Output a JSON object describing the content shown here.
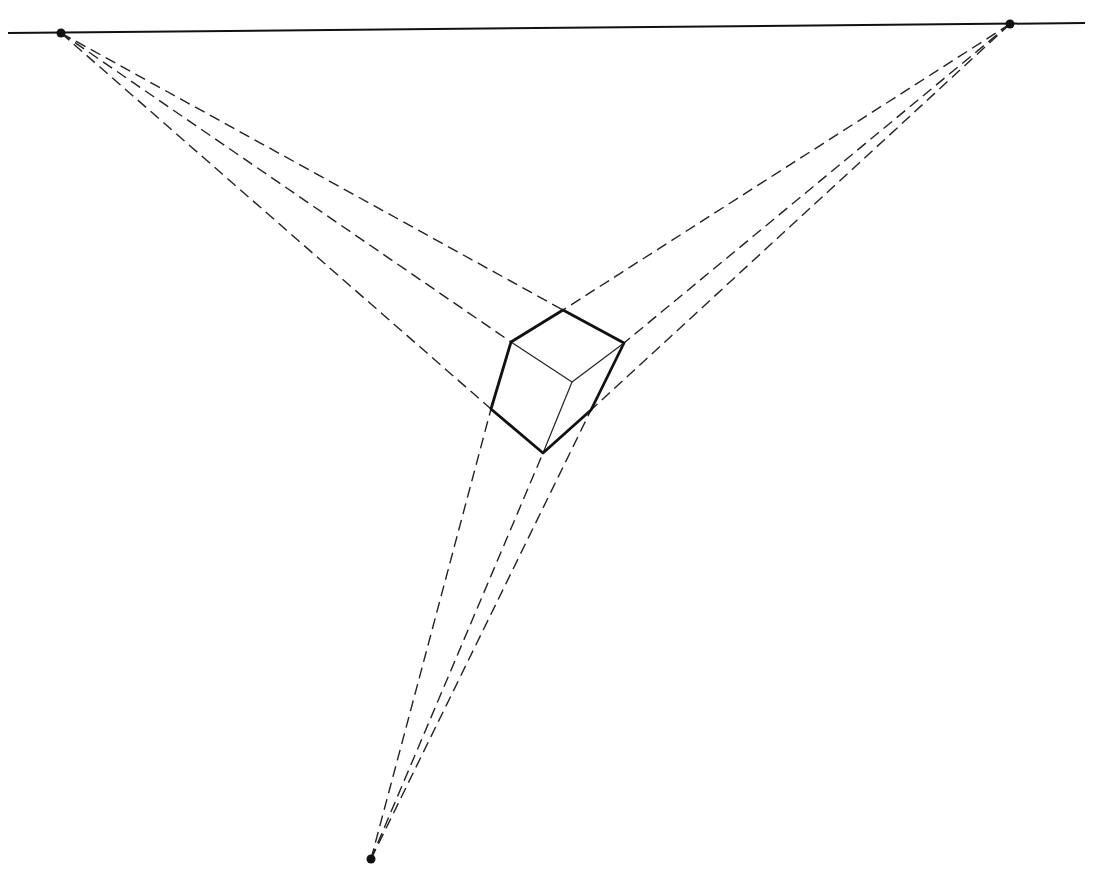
{
  "diagram": {
    "type": "three-point-perspective",
    "canvas": {
      "width": 1102,
      "height": 887,
      "background": "#ffffff"
    },
    "colors": {
      "ink": "#111111"
    },
    "horizon": {
      "x1": 8,
      "y1": 33,
      "x2": 1085,
      "y2": 23
    },
    "vanishing_points": [
      {
        "id": "vp-left",
        "x": 61,
        "y": 33
      },
      {
        "id": "vp-right",
        "x": 1010,
        "y": 24
      },
      {
        "id": "vp-bottom",
        "x": 371,
        "y": 859
      }
    ],
    "cube_vertices": {
      "top_back": [
        563,
        310
      ],
      "left_top": [
        511,
        342
      ],
      "right_top": [
        624,
        343
      ],
      "front_top": [
        572,
        382
      ],
      "left_bottom": [
        491,
        409
      ],
      "right_bottom": [
        591,
        410
      ],
      "bottom": [
        543,
        453
      ]
    },
    "construction_lines": [
      {
        "from": "vp-left",
        "to": "top_back"
      },
      {
        "from": "vp-left",
        "to": "left_top"
      },
      {
        "from": "vp-left",
        "to": "left_bottom"
      },
      {
        "from": "vp-right",
        "to": "top_back"
      },
      {
        "from": "vp-right",
        "to": "right_top"
      },
      {
        "from": "vp-right",
        "to": "right_bottom"
      },
      {
        "from": "vp-bottom",
        "to": "left_bottom"
      },
      {
        "from": "vp-bottom",
        "to": "bottom"
      },
      {
        "from": "vp-bottom",
        "to": "right_bottom"
      }
    ],
    "outline_edges": [
      [
        "top_back",
        "right_top"
      ],
      [
        "right_top",
        "right_bottom"
      ],
      [
        "right_bottom",
        "bottom"
      ],
      [
        "bottom",
        "left_bottom"
      ],
      [
        "left_bottom",
        "left_top"
      ],
      [
        "left_top",
        "top_back"
      ]
    ],
    "inner_edges": [
      [
        "left_top",
        "front_top"
      ],
      [
        "front_top",
        "right_top"
      ],
      [
        "front_top",
        "bottom"
      ]
    ]
  }
}
